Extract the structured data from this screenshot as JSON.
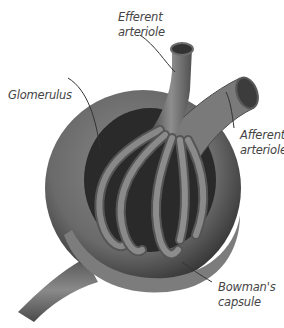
{
  "diagram": {
    "labels": {
      "efferent_arteriole": {
        "line1": "Efferent",
        "line2": "arteriole"
      },
      "glomerulus": {
        "line1": "Glomerulus"
      },
      "afferent_arteriole": {
        "line1": "Afferent",
        "line2": "arteriole"
      },
      "bowmans_capsule": {
        "line1": "Bowman's",
        "line2": "capsule"
      }
    }
  }
}
